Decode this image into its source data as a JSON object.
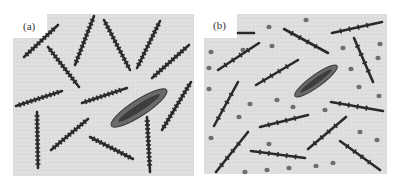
{
  "figure": {
    "panels": [
      {
        "label": "(a)",
        "description": "Rigid rod-like chains with pendant groups, randomly oriented, surrounding an elliptical guest molecule",
        "background": "#dcdcdc",
        "ellipse": {
          "cx": 139,
          "cy": 108,
          "rx": 33,
          "ry": 8,
          "angle": -33
        },
        "rods": [
          [
            24,
            57,
            58,
            25
          ],
          [
            48,
            47,
            79,
            87
          ],
          [
            75,
            65,
            94,
            16
          ],
          [
            104,
            20,
            130,
            70
          ],
          [
            137,
            68,
            160,
            21
          ],
          [
            152,
            78,
            189,
            45
          ],
          [
            16,
            106,
            62,
            91
          ],
          [
            82,
            103,
            127,
            88
          ],
          [
            37,
            112,
            38,
            168
          ],
          [
            51,
            150,
            88,
            119
          ],
          [
            90,
            137,
            133,
            159
          ],
          [
            147,
            117,
            150,
            172
          ],
          [
            162,
            130,
            191,
            82
          ]
        ]
      },
      {
        "label": "(b)",
        "description": "Rigid rod-like chains with sparse pendant groups plus dispersed small particles, surrounding an elliptical guest molecule",
        "background": "#dcdcdc",
        "ellipse": {
          "cx": 316,
          "cy": 81,
          "rx": 26,
          "ry": 6,
          "angle": -36
        },
        "rods": [
          [
            238,
            33,
            254,
            33
          ],
          [
            284,
            29,
            328,
            53
          ],
          [
            332,
            33,
            382,
            22
          ],
          [
            218,
            70,
            259,
            43
          ],
          [
            256,
            85,
            298,
            60
          ],
          [
            354,
            38,
            373,
            82
          ],
          [
            214,
            126,
            238,
            82
          ],
          [
            260,
            127,
            308,
            115
          ],
          [
            331,
            102,
            383,
            111
          ],
          [
            216,
            172,
            248,
            132
          ],
          [
            251,
            151,
            305,
            158
          ],
          [
            308,
            149,
            346,
            117
          ],
          [
            340,
            141,
            380,
            170
          ]
        ],
        "dots": [
          [
            306,
            20
          ],
          [
            269,
            27
          ],
          [
            380,
            44
          ],
          [
            378,
            58
          ],
          [
            211,
            52
          ],
          [
            209,
            68
          ],
          [
            243,
            50
          ],
          [
            272,
            46
          ],
          [
            343,
            48
          ],
          [
            351,
            69
          ],
          [
            209,
            89
          ],
          [
            359,
            87
          ],
          [
            379,
            96
          ],
          [
            277,
            100
          ],
          [
            250,
            104
          ],
          [
            293,
            107
          ],
          [
            325,
            110
          ],
          [
            239,
            117
          ],
          [
            360,
            132
          ],
          [
            211,
            138
          ],
          [
            377,
            140
          ],
          [
            269,
            144
          ],
          [
            245,
            172
          ],
          [
            267,
            170
          ],
          [
            289,
            168
          ],
          [
            316,
            166
          ],
          [
            333,
            163
          ]
        ]
      }
    ]
  }
}
